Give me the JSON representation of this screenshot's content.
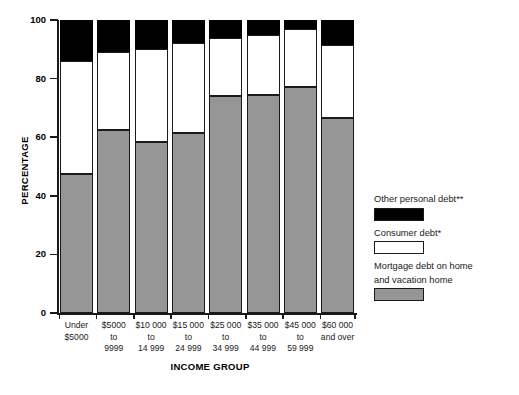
{
  "chart_data": {
    "type": "bar",
    "subtype": "stacked-bar-100",
    "title": "",
    "xlabel": "INCOME GROUP",
    "ylabel": "PERCENTAGE",
    "ylim": [
      0,
      100
    ],
    "yticks": [
      0,
      20,
      40,
      60,
      80,
      100
    ],
    "ytick_labels": [
      "0",
      "20",
      "40",
      "60",
      "80",
      "100"
    ],
    "grid": false,
    "legend_position": "right",
    "categories": [
      "Under\n$5000",
      "$5000\nto\n9999",
      "$10 000\nto\n14 999",
      "$15 000\nto\n24 999",
      "$25 000\nto\n34 999",
      "$35 000\nto\n44 999",
      "$45 000\nto\n59 999",
      "$60 000\nand over"
    ],
    "category_lines": [
      [
        "Under",
        "$5000"
      ],
      [
        "$5000",
        "to",
        "9999"
      ],
      [
        "$10 000",
        "to",
        "14 999"
      ],
      [
        "$15 000",
        "to",
        "24 999"
      ],
      [
        "$25 000",
        "to",
        "34 999"
      ],
      [
        "$35 000",
        "to",
        "44 999"
      ],
      [
        "$45 000",
        "to",
        "59 999"
      ],
      [
        "$60 000",
        "and over"
      ]
    ],
    "series": [
      {
        "name": "Mortgage debt on home and vacation home",
        "color": "#969696",
        "values": [
          47.5,
          62.5,
          58.5,
          61.5,
          74.0,
          74.5,
          77.0,
          66.5
        ]
      },
      {
        "name": "Consumer debt*",
        "color": "#ffffff",
        "values": [
          38.5,
          26.5,
          31.5,
          30.5,
          20.0,
          20.5,
          20.0,
          25.0
        ]
      },
      {
        "name": "Other personal debt**",
        "color": "#000000",
        "values": [
          14.0,
          11.0,
          10.0,
          8.0,
          6.0,
          5.0,
          3.0,
          8.5
        ]
      }
    ],
    "series_cumulative_tops": {
      "mortgage": [
        47.5,
        62.5,
        58.5,
        61.5,
        74.0,
        74.5,
        77.0,
        66.5
      ],
      "consumer": [
        86.0,
        89.0,
        90.0,
        92.0,
        94.0,
        95.0,
        97.0,
        91.5
      ],
      "other": [
        100,
        100,
        100,
        100,
        100,
        100,
        100,
        100
      ]
    }
  },
  "legend": {
    "entries": [
      {
        "label": "Other personal debt**",
        "swatch": "black-swatch"
      },
      {
        "label": "Consumer debt*",
        "swatch": "white-swatch"
      },
      {
        "label": "Mortgage debt on home and vacation home",
        "swatch": "gray-swatch"
      }
    ],
    "entry_lines": [
      [
        "Other personal debt**"
      ],
      [
        "Consumer debt*"
      ],
      [
        "Mortgage debt on home",
        "and vacation home"
      ]
    ]
  }
}
